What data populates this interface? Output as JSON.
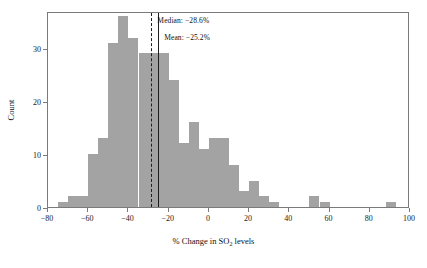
{
  "chart_data": {
    "type": "bar",
    "title": "",
    "xlabel_prefix": "% Change in SO",
    "xlabel_sub": "2",
    "xlabel_suffix": " levels",
    "xlabel": "% Change in SO2 levels",
    "ylabel": "Count",
    "xlim": [
      -80,
      100
    ],
    "ylim": [
      0,
      37
    ],
    "grid": false,
    "legend": "none",
    "bin_width": 5,
    "bar_color": "#a3a3a3",
    "x_ticks": [
      -80,
      -60,
      -40,
      -20,
      0,
      20,
      40,
      60,
      80,
      100
    ],
    "x_tick_labels": [
      "−80",
      "−60",
      "−40",
      "−20",
      "0",
      "20",
      "40",
      "60",
      "80",
      "100"
    ],
    "y_ticks": [
      0,
      10,
      20,
      30
    ],
    "y_tick_labels": [
      "0",
      "10",
      "20",
      "30"
    ],
    "bins": [
      {
        "x0": -75,
        "x1": -70,
        "count": 1
      },
      {
        "x0": -70,
        "x1": -65,
        "count": 2
      },
      {
        "x0": -65,
        "x1": -60,
        "count": 2
      },
      {
        "x0": -60,
        "x1": -55,
        "count": 10
      },
      {
        "x0": -55,
        "x1": -50,
        "count": 13
      },
      {
        "x0": -50,
        "x1": -45,
        "count": 31
      },
      {
        "x0": -45,
        "x1": -40,
        "count": 36
      },
      {
        "x0": -40,
        "x1": -35,
        "count": 32
      },
      {
        "x0": -35,
        "x1": -30,
        "count": 29
      },
      {
        "x0": -30,
        "x1": -25,
        "count": 29
      },
      {
        "x0": -25,
        "x1": -20,
        "count": 29
      },
      {
        "x0": -20,
        "x1": -15,
        "count": 24
      },
      {
        "x0": -15,
        "x1": -10,
        "count": 12
      },
      {
        "x0": -10,
        "x1": -5,
        "count": 16
      },
      {
        "x0": -5,
        "x1": 0,
        "count": 11
      },
      {
        "x0": 0,
        "x1": 5,
        "count": 13
      },
      {
        "x0": 5,
        "x1": 10,
        "count": 13
      },
      {
        "x0": 10,
        "x1": 15,
        "count": 8
      },
      {
        "x0": 15,
        "x1": 20,
        "count": 3
      },
      {
        "x0": 20,
        "x1": 25,
        "count": 5
      },
      {
        "x0": 25,
        "x1": 30,
        "count": 2
      },
      {
        "x0": 30,
        "x1": 35,
        "count": 1
      },
      {
        "x0": 50,
        "x1": 55,
        "count": 2
      },
      {
        "x0": 55,
        "x1": 60,
        "count": 1
      },
      {
        "x0": 88,
        "x1": 93,
        "count": 1
      }
    ],
    "reference_lines": [
      {
        "name": "median",
        "value": -28.6,
        "style": "dashed",
        "color": "#1d1d1d",
        "label": "Median: −28.6%"
      },
      {
        "name": "mean",
        "value": -25.2,
        "style": "solid",
        "color": "#1d1d1d",
        "label": "Mean: −25.2%"
      }
    ]
  },
  "annotations": {
    "median_label": "Median: −28.6%",
    "mean_label": "Mean: −25.2%"
  }
}
